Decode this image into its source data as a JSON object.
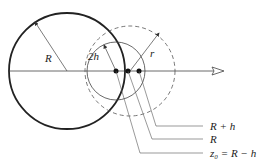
{
  "labels": {
    "R_big": "R",
    "two_h": "2h",
    "r": "r",
    "leader_1": "R + h",
    "leader_2": "R",
    "leader_3": "z₀ = R − h"
  },
  "colors": {
    "stroke": "#222222",
    "thin": "#555555"
  }
}
